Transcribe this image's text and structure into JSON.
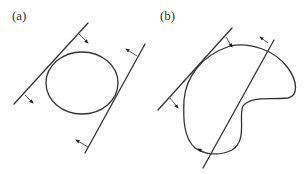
{
  "figure": {
    "panels": [
      {
        "label": "(a)",
        "shape": "circle",
        "description": "convex shape between two parallel support lines with inward normal arrows"
      },
      {
        "label": "(b)",
        "shape": "kidney-shaped closed curve",
        "description": "non-convex shape with a tangent support line and a secant line with normal arrows"
      }
    ],
    "colors": {
      "stroke": "#333333",
      "background": "#ffffff"
    }
  }
}
